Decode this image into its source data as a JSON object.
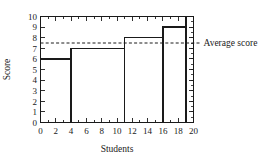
{
  "chart_data": {
    "type": "line",
    "subtype": "step-post",
    "title": "",
    "xlabel": "Students",
    "ylabel": "Score",
    "xlim": [
      0,
      20
    ],
    "ylim": [
      0,
      10
    ],
    "xticks": [
      0,
      2,
      4,
      6,
      8,
      10,
      12,
      14,
      16,
      18,
      20
    ],
    "xtick_labels": [
      "0",
      "2",
      "4",
      "6",
      "8",
      "10",
      "12",
      "14",
      "16",
      "18",
      "20"
    ],
    "xminor_step": 1,
    "yticks": [
      0,
      1,
      2,
      3,
      4,
      5,
      6,
      7,
      8,
      9,
      10
    ],
    "ytick_labels": [
      "0",
      "1",
      "2",
      "3",
      "4",
      "5",
      "6",
      "7",
      "8",
      "9",
      "10"
    ],
    "grid": false,
    "frame": "box",
    "tick_direction": "in",
    "series": [
      {
        "name": "Score distribution",
        "color": "#1a1a1a",
        "steps": [
          {
            "x_start": 0,
            "x_end": 4,
            "y": 6
          },
          {
            "x_start": 4,
            "x_end": 11,
            "y": 7
          },
          {
            "x_start": 11,
            "x_end": 16,
            "y": 8
          },
          {
            "x_start": 16,
            "x_end": 19,
            "y": 9
          },
          {
            "x_start": 19,
            "x_end": 20,
            "y": 10
          }
        ],
        "x": [
          0,
          4,
          4,
          11,
          11,
          16,
          16,
          19,
          19,
          20
        ],
        "y": [
          6,
          6,
          7,
          7,
          8,
          8,
          9,
          9,
          10,
          10
        ]
      }
    ],
    "annotations": [
      {
        "name": "average-score-line",
        "type": "hline",
        "y": 7.5,
        "label": "Average score",
        "style": "dashed",
        "color": "#1a1a1a",
        "label_position": "right-outside"
      }
    ]
  },
  "labels": {
    "xlabel": "Students",
    "ylabel": "Score",
    "average": "Average score"
  }
}
